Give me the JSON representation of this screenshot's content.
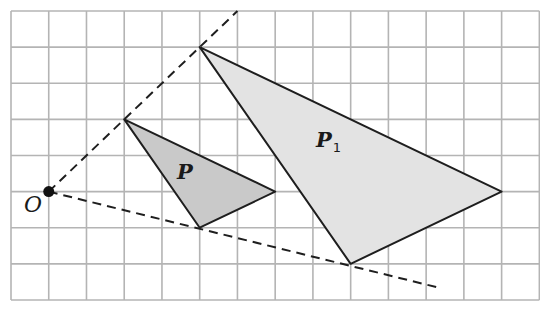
{
  "figure": {
    "grid": {
      "columns": 14,
      "rows": 8,
      "origin_px": [
        11,
        11
      ],
      "cell_px": [
        37.74,
        36.12
      ],
      "line_color": "#b4b4b4"
    },
    "centre": {
      "label": "O",
      "grid": [
        1,
        5
      ]
    },
    "shapes": [
      {
        "label": "P",
        "subscript": "",
        "vertices_grid": [
          [
            3,
            3
          ],
          [
            7,
            5
          ],
          [
            5,
            6
          ]
        ],
        "fill": "#c9c9c9"
      },
      {
        "label": "P",
        "subscript": "1",
        "vertices_grid": [
          [
            5,
            1
          ],
          [
            13,
            5
          ],
          [
            9,
            7
          ]
        ],
        "fill": "#e3e3e3"
      }
    ],
    "rays": [
      {
        "from_grid": [
          1,
          5
        ],
        "to_grid": [
          6,
          0
        ]
      },
      {
        "from_grid": [
          1,
          5
        ],
        "to_grid": [
          11.3,
          7.65
        ]
      }
    ],
    "scale_factor": 2,
    "stroke_color": "#1e1e1e"
  }
}
